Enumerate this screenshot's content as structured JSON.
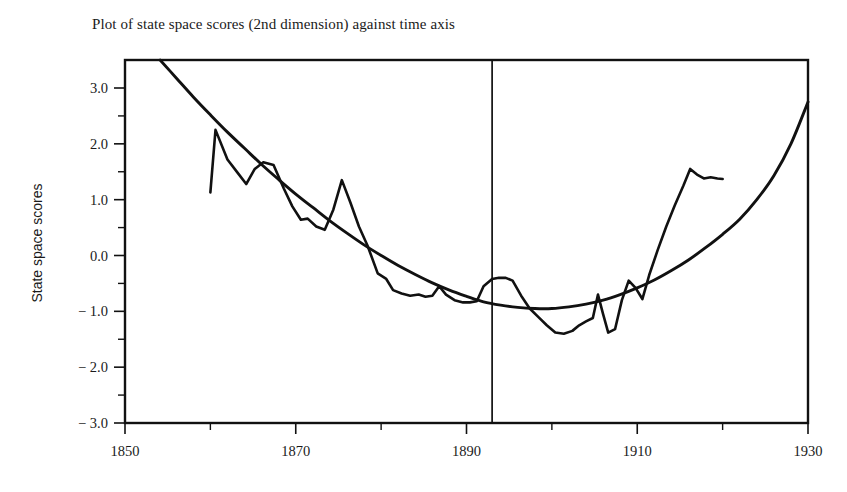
{
  "title": "Plot of state space scores (2nd dimension) against time axis",
  "y_axis_title": "State space scores",
  "axes": {
    "x_tick_labels": [
      "1850",
      "1870",
      "1890",
      "1910",
      "1930"
    ],
    "y_tick_labels": [
      "3.0",
      "2.0",
      "1.0",
      "0.0",
      "-1.0",
      "-2.0",
      "-3.0"
    ]
  },
  "colors": {
    "ink": "#111111",
    "background": "#ffffff"
  },
  "chart_data": {
    "type": "line",
    "title": "Plot of state space scores (2nd dimension) against time axis",
    "xlabel": "",
    "ylabel": "State space scores",
    "xlim": [
      1850,
      1930
    ],
    "ylim": [
      -3.0,
      3.0
    ],
    "x_ticks": [
      1850,
      1870,
      1890,
      1910,
      1930
    ],
    "x_minor_ticks": [
      1860,
      1880,
      1900,
      1920
    ],
    "y_ticks": [
      -3.0,
      -2.0,
      -1.0,
      0.0,
      1.0,
      2.0,
      3.0
    ],
    "y_minor_ticks": [
      -2.5,
      -1.5,
      -0.5,
      0.5,
      1.5,
      2.5
    ],
    "grid": false,
    "legend": "none",
    "annotations": [
      {
        "name": "vertical-reference-line",
        "type": "vline",
        "x": 1893,
        "label": ""
      }
    ],
    "series": [
      {
        "name": "Smooth fitted trend (quadratic)",
        "style": "smooth",
        "x": [
          1854,
          1856,
          1858,
          1860,
          1862,
          1864,
          1866,
          1868,
          1870,
          1872,
          1874,
          1876,
          1878,
          1880,
          1882,
          1884,
          1886,
          1888,
          1890,
          1892,
          1894,
          1896,
          1898,
          1900,
          1902,
          1904,
          1906,
          1908,
          1910,
          1912,
          1914,
          1916,
          1918,
          1920,
          1922,
          1924,
          1926,
          1928,
          1930
        ],
        "y": [
          3.52,
          3.18,
          2.84,
          2.52,
          2.21,
          1.92,
          1.63,
          1.36,
          1.1,
          0.86,
          0.62,
          0.4,
          0.19,
          0.0,
          -0.18,
          -0.34,
          -0.49,
          -0.62,
          -0.73,
          -0.83,
          -0.89,
          -0.93,
          -0.95,
          -0.95,
          -0.92,
          -0.87,
          -0.8,
          -0.7,
          -0.58,
          -0.44,
          -0.27,
          -0.08,
          0.14,
          0.38,
          0.65,
          1.0,
          1.43,
          2.0,
          2.75
        ]
      },
      {
        "name": "Observed state space scores",
        "style": "jagged",
        "x": [
          1860.0,
          1860.6,
          1862.0,
          1863.2,
          1864.2,
          1865.2,
          1866.2,
          1867.4,
          1868.6,
          1869.6,
          1870.6,
          1871.4,
          1872.4,
          1873.4,
          1874.4,
          1875.4,
          1876.4,
          1877.4,
          1878.4,
          1879.6,
          1880.6,
          1881.4,
          1882.4,
          1883.4,
          1884.4,
          1885.2,
          1886.0,
          1886.8,
          1887.6,
          1888.6,
          1889.6,
          1890.4,
          1891.2,
          1892.0,
          1893.0,
          1893.8,
          1894.6,
          1895.4,
          1896.4,
          1897.4,
          1898.4,
          1899.4,
          1900.4,
          1901.4,
          1902.4,
          1903.2,
          1904.0,
          1904.8,
          1905.4,
          1906.0,
          1906.6,
          1907.4,
          1908.2,
          1909.0,
          1909.8,
          1910.6,
          1911.4,
          1912.4,
          1913.4,
          1914.4,
          1915.4,
          1916.2,
          1917.0,
          1917.8,
          1918.6,
          1919.4,
          1920.0
        ],
        "y": [
          1.13,
          2.25,
          1.72,
          1.48,
          1.28,
          1.55,
          1.67,
          1.62,
          1.2,
          0.88,
          0.64,
          0.66,
          0.52,
          0.46,
          0.82,
          1.35,
          0.95,
          0.52,
          0.18,
          -0.32,
          -0.42,
          -0.62,
          -0.68,
          -0.72,
          -0.7,
          -0.74,
          -0.72,
          -0.55,
          -0.7,
          -0.8,
          -0.84,
          -0.84,
          -0.82,
          -0.55,
          -0.42,
          -0.4,
          -0.4,
          -0.45,
          -0.72,
          -0.95,
          -1.1,
          -1.25,
          -1.38,
          -1.4,
          -1.35,
          -1.25,
          -1.18,
          -1.12,
          -0.7,
          -1.05,
          -1.38,
          -1.32,
          -0.8,
          -0.45,
          -0.58,
          -0.78,
          -0.35,
          0.1,
          0.52,
          0.9,
          1.25,
          1.55,
          1.45,
          1.38,
          1.4,
          1.38,
          1.37
        ]
      }
    ]
  }
}
